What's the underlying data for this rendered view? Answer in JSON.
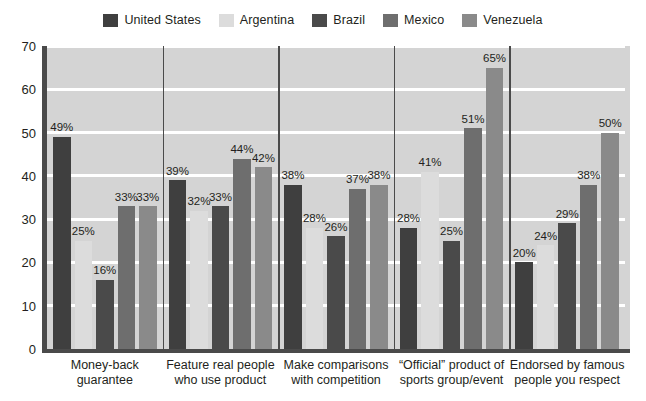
{
  "legend": {
    "items": [
      {
        "label": "United States",
        "color": "#3f3f3f",
        "key": "us"
      },
      {
        "label": "Argentina",
        "color": "#dcdcdc",
        "key": "ar"
      },
      {
        "label": "Brazil",
        "color": "#4a4a4a",
        "key": "br"
      },
      {
        "label": "Mexico",
        "color": "#6e6e6e",
        "key": "mx"
      },
      {
        "label": "Venezuela",
        "color": "#8a8a8a",
        "key": "ve"
      }
    ]
  },
  "axis": {
    "y_ticks": [
      "0",
      "10",
      "20",
      "30",
      "40",
      "50",
      "60",
      "70"
    ],
    "y_min": 0,
    "y_max": 70
  },
  "chart_data": {
    "type": "bar",
    "title": "",
    "subtitle": "",
    "xlabel": "",
    "ylabel": "",
    "ylim": [
      0,
      70
    ],
    "ytick_step": 10,
    "grid": true,
    "legend_position": "top",
    "value_suffix": "%",
    "categories": [
      "Money-back guarantee",
      "Feature real people who use product",
      "Make comparisons with competition",
      "“Official” product of sports group/event",
      "Endorsed by famous people you respect"
    ],
    "category_lines": [
      [
        "Money-back",
        "guarantee"
      ],
      [
        "Feature real people",
        "who use product"
      ],
      [
        "Make comparisons",
        "with competition"
      ],
      [
        "“Official” product of",
        "sports group/event"
      ],
      [
        "Endorsed by famous",
        "people you respect"
      ]
    ],
    "series": [
      {
        "name": "United States",
        "color": "#3f3f3f",
        "values": [
          49,
          39,
          38,
          28,
          20
        ],
        "labels": [
          "49%",
          "39%",
          "38%",
          "28%",
          "20%"
        ]
      },
      {
        "name": "Argentina",
        "color": "#dcdcdc",
        "values": [
          25,
          32,
          28,
          41,
          24
        ],
        "labels": [
          "25%",
          "32%",
          "28%",
          "41%",
          "24%"
        ]
      },
      {
        "name": "Brazil",
        "color": "#4a4a4a",
        "values": [
          16,
          33,
          26,
          25,
          29
        ],
        "labels": [
          "16%",
          "33%",
          "26%",
          "25%",
          "29%"
        ]
      },
      {
        "name": "Mexico",
        "color": "#6e6e6e",
        "values": [
          33,
          44,
          37,
          51,
          38
        ],
        "labels": [
          "33%",
          "44%",
          "37%",
          "51%",
          "38%"
        ]
      },
      {
        "name": "Venezuela",
        "color": "#8a8a8a",
        "values": [
          33,
          42,
          38,
          65,
          50
        ],
        "labels": [
          "33%",
          "42%",
          "38%",
          "65%",
          "50%"
        ]
      }
    ]
  },
  "colors": {
    "plot_background": "#d4d4d4",
    "gridline": "#ffffff",
    "axis": "#4a4a4a",
    "text": "#231f20",
    "page_background": "#ffffff"
  }
}
